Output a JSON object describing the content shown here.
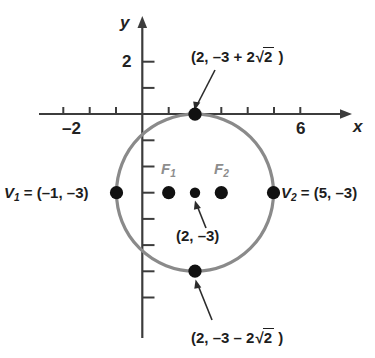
{
  "figure": {
    "type": "coordinate-plane-circle-diagram",
    "axes": {
      "x_axis_name": "x",
      "y_axis_name": "y",
      "x_tick_labels": [
        {
          "value": -2,
          "text": "–2"
        },
        {
          "value": 6,
          "text": "6"
        }
      ],
      "y_tick_labels": [
        {
          "value": 2,
          "text": "2"
        }
      ],
      "x_tick_values": [
        -3,
        -2,
        -1,
        1,
        2,
        3,
        4,
        5,
        6
      ],
      "y_tick_values": [
        2,
        1,
        -1,
        -2,
        -3,
        -4,
        -5,
        -6,
        -7
      ],
      "x_range": [
        -3.6,
        7.4
      ],
      "y_range": [
        -7.6,
        2.9
      ],
      "grid": false
    },
    "curve": {
      "shape": "circle",
      "center": [
        2,
        -3
      ],
      "radius": 3,
      "stroke_color": "#8a8a8a"
    },
    "points": [
      {
        "name": "top-point",
        "coords": [
          2,
          -0.172
        ],
        "label": "(2, –3 + 2√2 )"
      },
      {
        "name": "bottom-point",
        "coords": [
          2,
          -5.828
        ],
        "label": "(2, –3 – 2√2 )"
      },
      {
        "name": "left-vertex",
        "coords": [
          -1,
          -3
        ],
        "label": "V1 = (–1, –3)"
      },
      {
        "name": "right-vertex",
        "coords": [
          5,
          -3
        ],
        "label": "V2 = (5, –3)"
      },
      {
        "name": "focus-1",
        "coords": [
          1,
          -3
        ],
        "label": "F1"
      },
      {
        "name": "focus-2",
        "coords": [
          3,
          -3
        ],
        "label": "F2"
      },
      {
        "name": "center-point",
        "coords": [
          2,
          -3
        ],
        "label": "(2, –3)"
      }
    ],
    "labels": {
      "top_callout": {
        "prefix": "(2, –3 + 2",
        "radical_sign": "√",
        "radicand": "2",
        "suffix": " )"
      },
      "bottom_callout": {
        "prefix": "(2, –3 – 2",
        "radical_sign": "√",
        "radicand": "2",
        "suffix": " )"
      },
      "center_callout": "(2, –3)",
      "vertex_left": {
        "var": "V",
        "sub": "1",
        "value": " = (–1, –3)"
      },
      "vertex_right": {
        "var": "V",
        "sub": "2",
        "value": " = (5, –3)"
      },
      "focus_left": {
        "var": "F",
        "sub": "1"
      },
      "focus_right": {
        "var": "F",
        "sub": "2"
      },
      "x_axis": "x",
      "y_axis": "y",
      "x_tick_neg2": "–2",
      "x_tick_6": "6",
      "y_tick_2": "2"
    },
    "colors": {
      "background": "#ffffff",
      "axis": "#3c3c3c",
      "curve": "#8a8a8a",
      "point_fill": "#111111",
      "focus_text": "#8d8d8d",
      "text": "#1d1d1d",
      "leader": "#2b2b2b"
    }
  }
}
